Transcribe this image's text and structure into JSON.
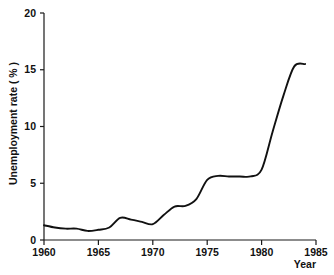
{
  "chart_data": {
    "type": "line",
    "title": "",
    "xlabel": "Year",
    "ylabel": "Unemployment rate ( % )",
    "xlim": [
      1960,
      1985
    ],
    "ylim": [
      0,
      20
    ],
    "grid": false,
    "legend": "none",
    "xticks": [
      "1960",
      "1965",
      "1970",
      "1975",
      "1980",
      "1985"
    ],
    "xtick_values": [
      1960,
      1965,
      1970,
      1975,
      1980,
      1985
    ],
    "yticks": [
      "0",
      "5",
      "10",
      "15",
      "20"
    ],
    "ytick_values": [
      0,
      5,
      10,
      15,
      20
    ],
    "series": [
      {
        "name": "Unemployment rate",
        "color": "#111111",
        "x": [
          1960,
          1961,
          1962,
          1963,
          1964,
          1965,
          1966,
          1967,
          1968,
          1969,
          1970,
          1971,
          1972,
          1973,
          1974,
          1975,
          1976,
          1977,
          1978,
          1979,
          1980,
          1981,
          1982,
          1983,
          1984
        ],
        "values": [
          1.3,
          1.1,
          1.0,
          1.0,
          0.8,
          0.9,
          1.1,
          1.95,
          1.8,
          1.6,
          1.4,
          2.2,
          2.95,
          3.0,
          3.6,
          5.3,
          5.65,
          5.6,
          5.6,
          5.6,
          6.2,
          9.5,
          12.7,
          15.3,
          15.5
        ]
      }
    ]
  },
  "axes": {
    "y_axis_title": "Unemployment rate ( % )",
    "x_axis_title": "Year"
  }
}
